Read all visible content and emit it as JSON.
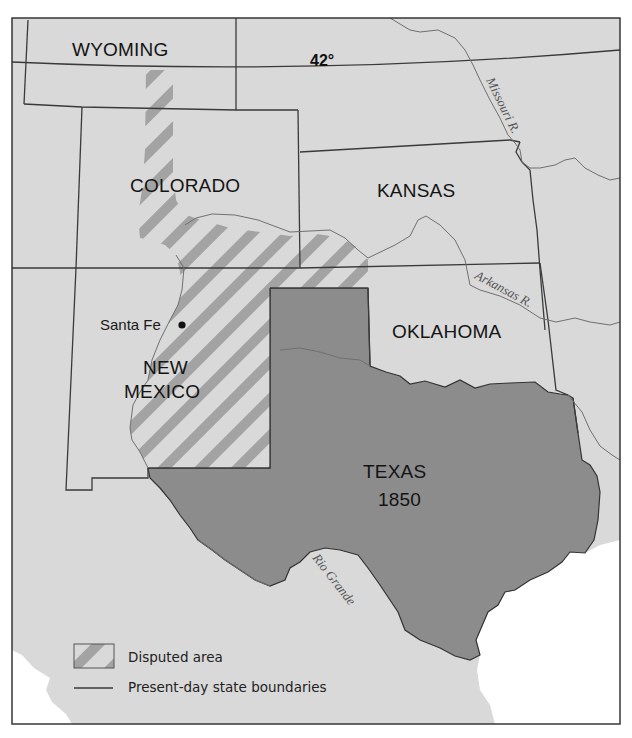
{
  "map": {
    "title_hidden": "Texas boundary dispute, 1850",
    "colors": {
      "land": "#d9d9d9",
      "texas": "#8c8c8c",
      "water": "#ffffff",
      "hatch_stripe": "#a3a3a3",
      "boundary": "#3a3a3a",
      "river": "#707070"
    },
    "latitude_label": "42°",
    "states": [
      {
        "id": "wyoming",
        "label": "WYOMING"
      },
      {
        "id": "colorado",
        "label": "COLORADO"
      },
      {
        "id": "kansas",
        "label": "KANSAS"
      },
      {
        "id": "oklahoma",
        "label": "OKLAHOMA"
      },
      {
        "id": "new-mexico",
        "label_line1": "NEW",
        "label_line2": "MEXICO"
      },
      {
        "id": "texas",
        "label_line1": "TEXAS",
        "label_line2": "1850"
      }
    ],
    "cities": [
      {
        "id": "santa-fe",
        "label": "Santa Fe"
      }
    ],
    "rivers": [
      {
        "id": "missouri",
        "label": "Missouri R."
      },
      {
        "id": "arkansas",
        "label": "Arkansas R."
      },
      {
        "id": "rio-grande",
        "label": "Rio Grande"
      }
    ],
    "legend": {
      "items": [
        {
          "symbol": "hatch",
          "label": "Disputed area"
        },
        {
          "symbol": "line",
          "label": "Present-day state boundaries"
        }
      ]
    }
  }
}
